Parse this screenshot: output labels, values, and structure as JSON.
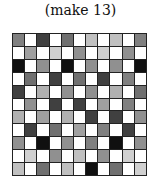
{
  "caption": "(make 13)",
  "grid": {
    "rows": 11,
    "cols": 11,
    "cells": [
      [
        "#808080",
        "#ffffff",
        "#404040",
        "#ffffff",
        "#707070",
        "#ffffff",
        "#c0c0c0",
        "#ffffff",
        "#c0c0c0",
        "#ffffff",
        "#808080"
      ],
      [
        "#ffffff",
        "#a0a0a0",
        "#ffffff",
        "#d0d0d0",
        "#ffffff",
        "#909090",
        "#ffffff",
        "#d0d0d0",
        "#ffffff",
        "#909090",
        "#ffffff"
      ],
      [
        "#101010",
        "#ffffff",
        "#909090",
        "#ffffff",
        "#101010",
        "#ffffff",
        "#909090",
        "#ffffff",
        "#909090",
        "#ffffff",
        "#101010"
      ],
      [
        "#ffffff",
        "#707070",
        "#ffffff",
        "#404040",
        "#ffffff",
        "#707070",
        "#ffffff",
        "#404040",
        "#ffffff",
        "#808080",
        "#ffffff"
      ],
      [
        "#404040",
        "#ffffff",
        "#b0b0b0",
        "#ffffff",
        "#909090",
        "#ffffff",
        "#909090",
        "#ffffff",
        "#b0b0b0",
        "#ffffff",
        "#707070"
      ],
      [
        "#ffffff",
        "#909090",
        "#ffffff",
        "#404040",
        "#ffffff",
        "#404040",
        "#ffffff",
        "#a0a0a0",
        "#ffffff",
        "#808080",
        "#ffffff"
      ],
      [
        "#b0b0b0",
        "#ffffff",
        "#a0a0a0",
        "#ffffff",
        "#b0b0b0",
        "#ffffff",
        "#404040",
        "#ffffff",
        "#404040",
        "#ffffff",
        "#909090"
      ],
      [
        "#ffffff",
        "#404040",
        "#ffffff",
        "#707070",
        "#ffffff",
        "#a0a0a0",
        "#ffffff",
        "#808080",
        "#ffffff",
        "#404040",
        "#ffffff"
      ],
      [
        "#909090",
        "#ffffff",
        "#101010",
        "#ffffff",
        "#909090",
        "#ffffff",
        "#808080",
        "#ffffff",
        "#101010",
        "#ffffff",
        "#909090"
      ],
      [
        "#ffffff",
        "#d0d0d0",
        "#ffffff",
        "#909090",
        "#ffffff",
        "#c0c0c0",
        "#ffffff",
        "#909090",
        "#ffffff",
        "#d0d0d0",
        "#ffffff"
      ],
      [
        "#c0c0c0",
        "#ffffff",
        "#707070",
        "#ffffff",
        "#c0c0c0",
        "#ffffff",
        "#101010",
        "#ffffff",
        "#707070",
        "#ffffff",
        "#d0d0d0"
      ]
    ]
  }
}
